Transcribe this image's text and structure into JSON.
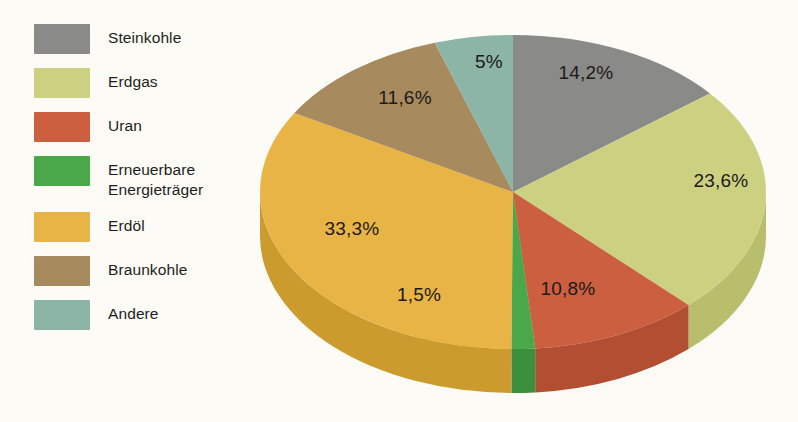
{
  "legend": {
    "items": [
      {
        "label": "Steinkohle",
        "color": "#8a8a88"
      },
      {
        "label": "Erdgas",
        "color": "#ccd182"
      },
      {
        "label": "Uran",
        "color": "#cb5f40"
      },
      {
        "label": "Erneuerbare\nEnergieträger",
        "color": "#4aa74a"
      },
      {
        "label": "Erdöl",
        "color": "#e8b445"
      },
      {
        "label": "Braunkohle",
        "color": "#a78a5e"
      },
      {
        "label": "Andere",
        "color": "#8cb4a7"
      }
    ]
  },
  "chart_data": {
    "type": "pie",
    "title": "",
    "subtitle": "",
    "xlabel": "",
    "ylabel": "",
    "legend_position": "left",
    "grid": false,
    "three_d": true,
    "start_angle_deg": 0,
    "direction": "clockwise",
    "categories": [
      "Steinkohle",
      "Erdgas",
      "Uran",
      "Erneuerbare Energieträger",
      "Erdöl",
      "Braunkohle",
      "Andere"
    ],
    "values": [
      14.2,
      23.6,
      10.8,
      1.5,
      33.3,
      11.6,
      5.0
    ],
    "value_labels": [
      "14,2%",
      "23,6%",
      "10,8%",
      "1,5%",
      "33,3%",
      "11,6%",
      "5%"
    ],
    "colors": [
      "#8a8a88",
      "#ccd182",
      "#cb5f40",
      "#4aa74a",
      "#e8b445",
      "#a78a5e",
      "#8cb4a7"
    ],
    "side_colors": [
      "#6f6f6d",
      "#b9be6c",
      "#b24f32",
      "#3c8f3c",
      "#cc9b2e",
      "#8e7349",
      "#769a8e"
    ],
    "unit": "%",
    "total": 100.0
  },
  "slice_labels": [
    {
      "text": "14,2%",
      "x": 586,
      "y": 74
    },
    {
      "text": "23,6%",
      "x": 721,
      "y": 182
    },
    {
      "text": "10,8%",
      "x": 568,
      "y": 290
    },
    {
      "text": "1,5%",
      "x": 419,
      "y": 296
    },
    {
      "text": "33,3%",
      "x": 352,
      "y": 230
    },
    {
      "text": "11,6%",
      "x": 405,
      "y": 99
    },
    {
      "text": "5%",
      "x": 489,
      "y": 63
    }
  ]
}
